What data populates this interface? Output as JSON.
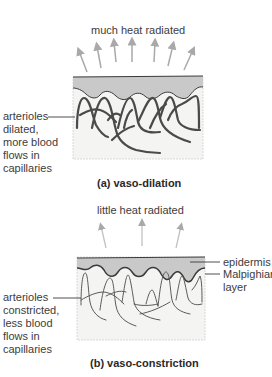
{
  "panel_a": {
    "heat_label": "much heat radiated",
    "side_label": [
      "arterioles",
      "dilated,",
      "more blood",
      "flows in",
      "capillaries"
    ],
    "caption": "(a)  vaso-dilation"
  },
  "panel_b": {
    "heat_label": "little heat radiated",
    "side_label": [
      "arterioles",
      "constricted,",
      "less blood",
      "flows in",
      "capillaries"
    ],
    "right_labels": [
      "epidermis",
      "Malpighian",
      "layer"
    ],
    "caption": "(b)  vaso-constriction"
  },
  "colors": {
    "epidermis": "#c9c9c9",
    "dermis": "#f4f4f2",
    "vessel": "#4a4a4a",
    "arrow": "#a9a9a9"
  }
}
